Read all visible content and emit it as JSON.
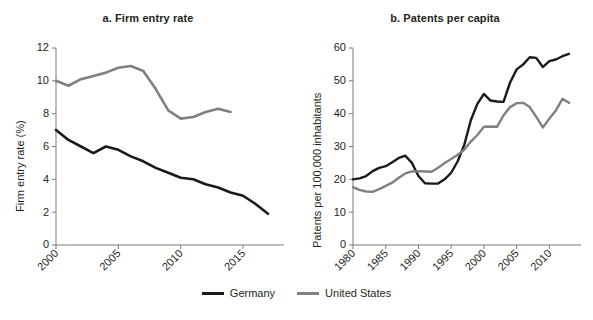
{
  "figure": {
    "background": "#ffffff",
    "colors": {
      "germany": "#1a1a1a",
      "united_states": "#808080",
      "axis": "#7b7b7b",
      "text": "#231f20"
    }
  },
  "legend": {
    "position": "bottom-center",
    "entries": [
      {
        "label": "Germany",
        "color": "#1a1a1a"
      },
      {
        "label": "United States",
        "color": "#808080"
      }
    ]
  },
  "chart_data": [
    {
      "type": "line",
      "panel": "a",
      "title": "a. Firm entry rate",
      "xlabel": "",
      "ylabel": "Firm entry rate (%)",
      "xlim": [
        2000,
        2017
      ],
      "ylim": [
        0,
        12
      ],
      "yticks": [
        0,
        2,
        4,
        6,
        8,
        10,
        12
      ],
      "ytick_labels": [
        "0",
        "2",
        "4",
        "6",
        "8",
        "10",
        "12"
      ],
      "xticks": [
        2000,
        2005,
        2010,
        2015
      ],
      "xtick_labels": [
        "2000",
        "2005",
        "2010",
        "2015"
      ],
      "grid": false,
      "series": [
        {
          "name": "Germany",
          "color": "#1a1a1a",
          "x": [
            2000,
            2001,
            2002,
            2003,
            2004,
            2005,
            2006,
            2007,
            2008,
            2009,
            2010,
            2011,
            2012,
            2013,
            2014,
            2015,
            2016,
            2017
          ],
          "values": [
            7.0,
            6.4,
            6.0,
            5.6,
            6.0,
            5.8,
            5.4,
            5.1,
            4.7,
            4.4,
            4.1,
            4.0,
            3.7,
            3.5,
            3.2,
            3.0,
            2.5,
            1.9
          ]
        },
        {
          "name": "United States",
          "color": "#808080",
          "x": [
            2000,
            2001,
            2002,
            2003,
            2004,
            2005,
            2006,
            2007,
            2008,
            2009,
            2010,
            2011,
            2012,
            2013,
            2014
          ],
          "values": [
            10.0,
            9.7,
            10.1,
            10.3,
            10.5,
            10.8,
            10.9,
            10.6,
            9.5,
            8.2,
            7.7,
            7.8,
            8.1,
            8.3,
            8.1
          ]
        }
      ]
    },
    {
      "type": "line",
      "panel": "b",
      "title": "b. Patents per capita",
      "xlabel": "",
      "ylabel": "Patents per 100,000 inhabitants",
      "xlim": [
        1980,
        2013
      ],
      "ylim": [
        0,
        60
      ],
      "yticks": [
        0,
        10,
        20,
        30,
        40,
        50,
        60
      ],
      "ytick_labels": [
        "0",
        "10",
        "20",
        "30",
        "40",
        "50",
        "60"
      ],
      "xticks": [
        1980,
        1985,
        1990,
        1995,
        2000,
        2005,
        2010
      ],
      "xtick_labels": [
        "1980",
        "1985",
        "1990",
        "1995",
        "2000",
        "2005",
        "2010"
      ],
      "grid": false,
      "series": [
        {
          "name": "Germany",
          "color": "#1a1a1a",
          "x": [
            1980,
            1981,
            1982,
            1983,
            1984,
            1985,
            1986,
            1987,
            1988,
            1989,
            1990,
            1991,
            1992,
            1993,
            1994,
            1995,
            1996,
            1997,
            1998,
            1999,
            2000,
            2001,
            2002,
            2003,
            2004,
            2005,
            2006,
            2007,
            2008,
            2009,
            2010,
            2011,
            2012,
            2013
          ],
          "values": [
            20.0,
            20.3,
            21.0,
            22.5,
            23.5,
            24.0,
            25.2,
            26.5,
            27.2,
            25.0,
            21.0,
            18.8,
            18.7,
            18.7,
            20.0,
            22.0,
            25.5,
            30.5,
            38.0,
            43.0,
            46.0,
            44.0,
            43.7,
            43.6,
            49.5,
            53.5,
            55.0,
            57.2,
            57.0,
            54.2,
            56.0,
            56.5,
            57.5,
            58.2
          ]
        },
        {
          "name": "United States",
          "color": "#808080",
          "x": [
            1980,
            1981,
            1982,
            1983,
            1984,
            1985,
            1986,
            1987,
            1988,
            1989,
            1990,
            1991,
            1992,
            1993,
            1994,
            1995,
            1996,
            1997,
            1998,
            1999,
            2000,
            2001,
            2002,
            2003,
            2004,
            2005,
            2006,
            2007,
            2008,
            2009,
            2010,
            2011,
            2012,
            2013
          ],
          "values": [
            17.6,
            16.8,
            16.3,
            16.2,
            17.0,
            18.0,
            19.0,
            20.5,
            21.8,
            22.4,
            22.5,
            22.4,
            22.3,
            23.5,
            25.0,
            26.2,
            27.5,
            29.0,
            31.5,
            33.5,
            36.0,
            36.1,
            36.0,
            39.5,
            42.0,
            43.2,
            43.3,
            42.0,
            39.0,
            35.8,
            38.5,
            41.0,
            44.5,
            43.3
          ]
        }
      ]
    }
  ]
}
